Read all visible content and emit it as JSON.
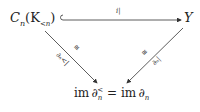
{
  "diagram": {
    "nodes": {
      "source": "Cₙ(K₍<ₙ₎)",
      "source_main": "C",
      "source_sub": "n",
      "source_arg": "(K",
      "source_arg_sub": "<n",
      "source_close": ")",
      "target": "Y",
      "bottom": "im ∂ₙ< = im ∂ₙ",
      "bottom_left": "im ∂",
      "bottom_left_sub": "n",
      "bottom_left_sup": "<",
      "bottom_eq": " = im ∂",
      "bottom_right_sub": "n"
    },
    "edges": [
      {
        "from": "source",
        "to": "target",
        "label": "i|",
        "style": "hook-arrow"
      },
      {
        "from": "source",
        "to": "bottom",
        "label": "∂ₙ<|",
        "iso": "≅"
      },
      {
        "from": "target",
        "to": "bottom",
        "label": "∂ₙ|",
        "iso": "≅"
      }
    ]
  }
}
